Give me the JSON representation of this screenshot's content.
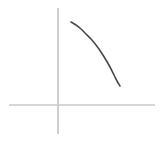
{
  "figure": {
    "title": "",
    "background_color": "#ffffff",
    "width": 163,
    "height": 141
  },
  "chart_data": {
    "type": "line",
    "title": "",
    "subtitle": "",
    "xlabel": "",
    "ylabel": "",
    "legend": [],
    "legend_position": "none",
    "grid": false,
    "annotations": [],
    "axes": {
      "style": "cartesian-cross",
      "origin_px": {
        "x": 58,
        "y": 105
      },
      "x_axis": {
        "label": "",
        "tick_labels": [],
        "color": "#c9c9c9",
        "stroke_width": 1.4,
        "start_px": {
          "x": 9,
          "y": 105
        },
        "end_px": {
          "x": 155,
          "y": 105
        }
      },
      "y_axis": {
        "label": "",
        "tick_labels": [],
        "color": "#c9c9c9",
        "stroke_width": 1.8,
        "start_px": {
          "x": 58,
          "y": 8
        },
        "end_px": {
          "x": 58,
          "y": 134
        }
      }
    },
    "series": [
      {
        "name": "curve",
        "color": "#4a4a4a",
        "stroke_width": 1.6,
        "style": "hand-drawn",
        "shape": "decreasing-concave-down",
        "points_px": [
          {
            "x": 71,
            "y": 22
          },
          {
            "x": 76,
            "y": 25
          },
          {
            "x": 81,
            "y": 29
          },
          {
            "x": 86,
            "y": 34
          },
          {
            "x": 91,
            "y": 39
          },
          {
            "x": 96,
            "y": 45
          },
          {
            "x": 101,
            "y": 52
          },
          {
            "x": 106,
            "y": 60
          },
          {
            "x": 110,
            "y": 67
          },
          {
            "x": 114,
            "y": 75
          },
          {
            "x": 117,
            "y": 81
          },
          {
            "x": 120,
            "y": 86
          }
        ]
      }
    ]
  }
}
